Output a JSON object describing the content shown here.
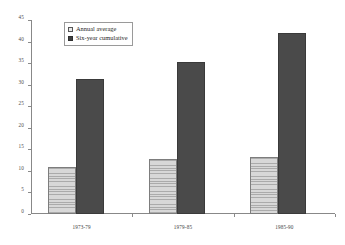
{
  "chart_data": {
    "type": "bar",
    "title": "",
    "subtitle": "",
    "xlabel": "",
    "ylabel": "",
    "categories": [
      "1973-79",
      "1979-85",
      "1985-90"
    ],
    "series": [
      {
        "name": "Annual average",
        "values": [
          11.0,
          12.7,
          13.2
        ],
        "color": "#c3c3c3",
        "fill": "horizontal-hatch"
      },
      {
        "name": "Six-year cumulative",
        "values": [
          31.3,
          35.2,
          42.0
        ],
        "color": "#4a4a4a",
        "fill": "solid"
      }
    ],
    "ylim": [
      0,
      45
    ],
    "ytick_values": [
      0,
      5,
      10,
      15,
      20,
      25,
      30,
      35,
      40,
      45
    ],
    "ytick_labels": [
      "0",
      "5",
      "10",
      "15",
      "20",
      "25",
      "30",
      "35",
      "40",
      "45"
    ],
    "grid": false,
    "legend_position": "top-left-inside",
    "legend_entries": [
      "Annual average",
      "Six-year cumulative"
    ]
  }
}
